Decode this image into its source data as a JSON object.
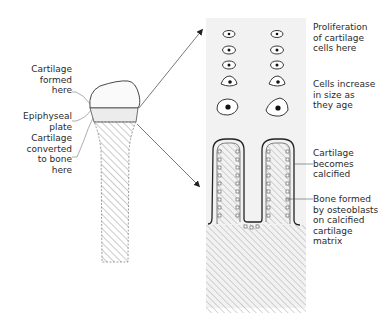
{
  "figure": {
    "left_labels": [
      {
        "id": "cartilage-formed",
        "text": "Cartilage\nformed\nhere"
      },
      {
        "id": "epiphyseal-plate",
        "text": "Epiphyseal\nplate"
      },
      {
        "id": "cartilage-converted",
        "text": "Cartilage\nconverted\nto bone\nhere"
      }
    ],
    "right_labels": [
      {
        "id": "proliferation",
        "text": "Proliferation\nof cartilage\ncells here"
      },
      {
        "id": "cells-increase",
        "text": "Cells increase\nin size as\nthey age"
      },
      {
        "id": "cartilage-calcified",
        "text": "Cartilage\nbecomes\ncalcified"
      },
      {
        "id": "bone-formed",
        "text": "Bone formed\nby osteoblasts\non calcified\ncartilage\nmatrix"
      }
    ],
    "colors": {
      "ink": "#2a2a2a",
      "hatch": "#8a8a8a",
      "panel_bg": "#f2f2f2",
      "plate_fill": "#ececec"
    }
  }
}
